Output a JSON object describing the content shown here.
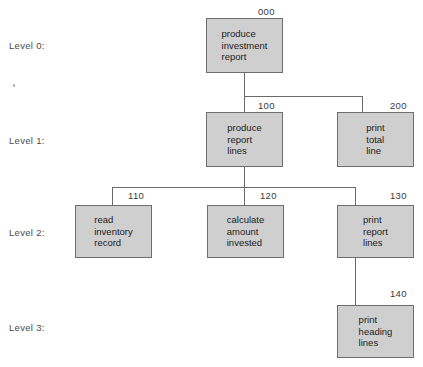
{
  "diagram": {
    "type": "structure-chart",
    "level_labels": [
      {
        "text": "Level 0:"
      },
      {
        "text": "Level 1:"
      },
      {
        "text": "Level 2:"
      },
      {
        "text": "Level 3:"
      }
    ],
    "modules": [
      {
        "ref": "000",
        "level": 0,
        "line1": "produce",
        "line2": "investment",
        "line3": "report"
      },
      {
        "ref": "100",
        "level": 1,
        "line1": "produce",
        "line2": "report",
        "line3": "lines"
      },
      {
        "ref": "200",
        "level": 1,
        "line1": "print",
        "line2": "total",
        "line3": "line"
      },
      {
        "ref": "110",
        "level": 2,
        "line1": "read",
        "line2": "inventory",
        "line3": "record"
      },
      {
        "ref": "120",
        "level": 2,
        "line1": "calculate",
        "line2": "amount",
        "line3": "invested"
      },
      {
        "ref": "130",
        "level": 2,
        "line1": "print",
        "line2": "report",
        "line3": "lines"
      },
      {
        "ref": "140",
        "level": 3,
        "line1": "print",
        "line2": "heading",
        "line3": "lines"
      }
    ],
    "colors": {
      "box_fill": "#cfcfcf",
      "box_border": "#6e6e6e",
      "connector": "#6a6a6a",
      "text": "#1c1c1c",
      "label_text": "#4a4a4a",
      "background": "#ffffff"
    }
  }
}
